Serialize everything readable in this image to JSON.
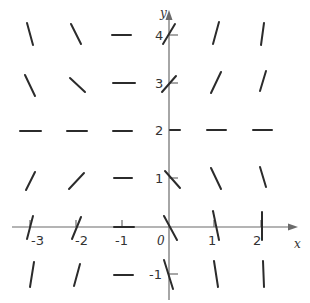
{
  "diagram": {
    "type": "slope-field",
    "equation_implied": "dy/dx = (x+1)(y-2)",
    "axes": {
      "x_label": "x",
      "y_label": "y",
      "origin_label": "0",
      "x_ticks": [
        "-3",
        "-2",
        "-1",
        "1",
        "2"
      ],
      "y_ticks": [
        "4",
        "3",
        "2",
        "1",
        "-1"
      ]
    },
    "grid": {
      "x_values": [
        -3,
        -2,
        -1,
        0,
        1,
        2
      ],
      "y_values": [
        4,
        3,
        2,
        1,
        0,
        -1
      ]
    },
    "colors": {
      "segment": "#2b2b2b",
      "axis": "#6b6b6b",
      "background": "#ffffff"
    }
  }
}
